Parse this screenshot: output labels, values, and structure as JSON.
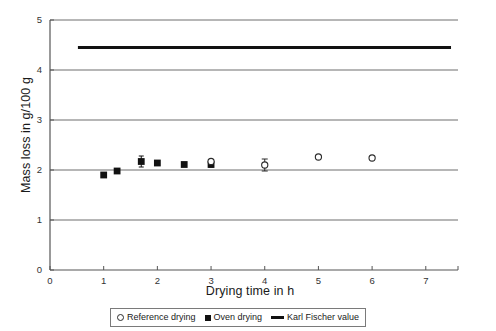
{
  "chart_data": {
    "type": "scatter",
    "title": "",
    "xlabel": "Drying time in h",
    "ylabel": "Mass loss in g/100 g",
    "xlim": [
      0,
      7.6
    ],
    "ylim": [
      0,
      5
    ],
    "xticks": [
      "0",
      "1",
      "2",
      "3",
      "4",
      "5",
      "6",
      "7"
    ],
    "xtick_values": [
      0,
      1,
      2,
      3,
      4,
      5,
      6,
      7
    ],
    "yticks": [
      "0",
      "1",
      "2",
      "3",
      "4",
      "5"
    ],
    "ytick_values": [
      0,
      1,
      2,
      3,
      4,
      5
    ],
    "grid": "horizontal",
    "legend_position": "bottom",
    "series": [
      {
        "name": "Oven drying",
        "marker": "filled-square",
        "color": "#111111",
        "points": [
          {
            "x": 1.0,
            "y": 1.9,
            "yerr": 0.0
          },
          {
            "x": 1.25,
            "y": 1.98,
            "yerr": 0.0
          },
          {
            "x": 1.7,
            "y": 2.17,
            "yerr": 0.11
          },
          {
            "x": 2.0,
            "y": 2.14,
            "yerr": 0.0
          },
          {
            "x": 2.5,
            "y": 2.11,
            "yerr": 0.0
          },
          {
            "x": 3.0,
            "y": 2.11,
            "yerr": 0.05
          }
        ]
      },
      {
        "name": "Reference drying",
        "marker": "open-circle",
        "color": "#2b2b2b",
        "points": [
          {
            "x": 3.0,
            "y": 2.17,
            "yerr": 0.0
          },
          {
            "x": 4.0,
            "y": 2.1,
            "yerr": 0.12
          },
          {
            "x": 5.0,
            "y": 2.26,
            "yerr": 0.0
          },
          {
            "x": 6.0,
            "y": 2.24,
            "yerr": 0.0
          }
        ]
      },
      {
        "name": "Karl Fischer value",
        "marker": "thick-line",
        "color": "#111111",
        "line": {
          "y": 4.45,
          "x_start": 0.52,
          "x_end": 7.47
        }
      }
    ]
  },
  "legend": {
    "entries": [
      {
        "label": "Reference drying",
        "marker": "open-circle"
      },
      {
        "label": "Oven drying",
        "marker": "filled-square"
      },
      {
        "label": "Karl Fischer value",
        "marker": "thick-line"
      }
    ]
  },
  "axes": {
    "x_title": "Drying time in h",
    "y_title": "Mass loss in g/100 g"
  }
}
